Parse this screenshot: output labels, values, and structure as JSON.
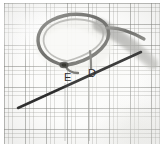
{
  "figure": {
    "kind": "grayscale-micrograph",
    "background": "graph-paper-grid",
    "paper_color": "#fcfcfb",
    "grid_color": "#96968f",
    "ink_color": "#4a4a4a",
    "label_color": "#2e2e2e",
    "width": 164,
    "height": 147
  },
  "labels": [
    {
      "id": "E",
      "text": "E",
      "x": 60,
      "y": 69
    },
    {
      "id": "D",
      "text": "D",
      "x": 84,
      "y": 65
    }
  ],
  "annotations": {
    "leader_lines": [
      {
        "from_label": "E",
        "orientation": "vertical",
        "x": 65,
        "y_start": 83,
        "y_end": 140
      },
      {
        "from_label": "D",
        "orientation": "vertical",
        "x": 89,
        "y_start": 80,
        "y_end": 140
      }
    ],
    "pointer": {
      "name": "needle-pointer",
      "x1": 18,
      "y1": 108,
      "x2": 141,
      "y2": 52,
      "color": "#3c3c3c"
    }
  },
  "specimen": {
    "name": "looped-filament",
    "description": "dark looped fiber forming a closed loop with a crossing node near label E and a thick band trailing to the lower right",
    "loop_center_x": 72,
    "loop_center_y": 40,
    "node_x": 62,
    "node_y": 64
  }
}
